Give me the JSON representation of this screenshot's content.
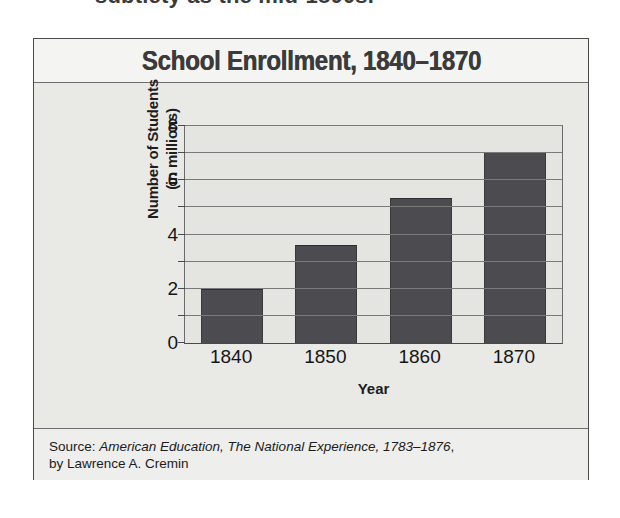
{
  "page": {
    "cutoff_text_top": "subtlety as the mid-1800s."
  },
  "figure": {
    "title": "School Enrollment, 1840–1870",
    "y_axis_title_line1": "Number of Students",
    "y_axis_title_line2": "(in millions)",
    "x_axis_title": "Year",
    "source_prefix": "Source: ",
    "source_booktitle": "American Education, The National Experience, 1783–1876",
    "source_suffix": ",",
    "source_author_line": "by Lawrence A. Cremin",
    "colors": {
      "bar_fill": "#4c4c50",
      "card_background": "#e9e9e6",
      "plot_background": "#e4e4e1",
      "gridline": "#7a7a7a",
      "border": "#4a4a4a",
      "title_text": "#3b3b3b"
    }
  },
  "chart_data": {
    "type": "bar",
    "title": "School Enrollment, 1840–1870",
    "xlabel": "Year",
    "ylabel": "Number of Students (in millions)",
    "categories": [
      "1840",
      "1850",
      "1860",
      "1870"
    ],
    "values": [
      2.0,
      3.6,
      5.35,
      7.05
    ],
    "ylim": [
      0,
      8
    ],
    "ytick_labels": [
      "0",
      "2",
      "4",
      "6",
      "8"
    ],
    "ytick_values": [
      0,
      2,
      4,
      6,
      8
    ],
    "minor_gridline_values": [
      1,
      3,
      5,
      7
    ],
    "grid": "horizontal",
    "legend": "none",
    "series": [
      {
        "name": "Number of Students (in millions)",
        "values": [
          2.0,
          3.6,
          5.35,
          7.05
        ]
      }
    ],
    "annotations": [
      "Source: American Education, The National Experience, 1783–1876, by Lawrence A. Cremin"
    ]
  }
}
